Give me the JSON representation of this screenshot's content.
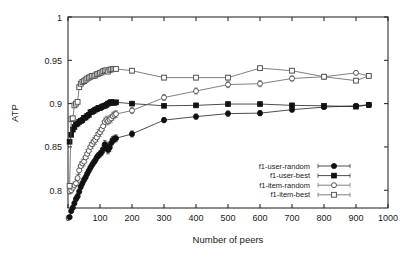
{
  "chart_data": {
    "type": "line",
    "title": "",
    "xlabel": "Number of peers",
    "ylabel": "ATP",
    "xlim": [
      0,
      1000
    ],
    "ylim": [
      0.7795,
      1.0
    ],
    "grid": false,
    "legend_position": "lower-right-inside",
    "xticks": [
      "0",
      "100",
      "200",
      "300",
      "400",
      "500",
      "600",
      "700",
      "800",
      "900",
      "1000"
    ],
    "xtick_values": [
      0,
      100,
      200,
      300,
      400,
      500,
      600,
      700,
      800,
      900,
      1000
    ],
    "yticks": [
      "0.8",
      "0.85",
      "0.9",
      "0.95",
      "1"
    ],
    "ytick_values": [
      0.8,
      0.85,
      0.9,
      0.95,
      1.0
    ],
    "series": [
      {
        "name": "f1-user-random",
        "marker": "filled-circle",
        "color": "#111111",
        "x": [
          5,
          10,
          15,
          20,
          25,
          30,
          35,
          40,
          45,
          50,
          55,
          60,
          65,
          70,
          75,
          80,
          85,
          90,
          95,
          100,
          105,
          110,
          115,
          120,
          125,
          130,
          135,
          140,
          145,
          150,
          200,
          300,
          400,
          500,
          600,
          700,
          800,
          900,
          940
        ],
        "values": [
          0.769,
          0.776,
          0.78,
          0.785,
          0.79,
          0.793,
          0.7985,
          0.804,
          0.808,
          0.812,
          0.815,
          0.819,
          0.8225,
          0.826,
          0.829,
          0.832,
          0.8345,
          0.838,
          0.84,
          0.842,
          0.844,
          0.8475,
          0.853,
          0.851,
          0.8465,
          0.849,
          0.8545,
          0.858,
          0.859,
          0.86,
          0.865,
          0.881,
          0.885,
          0.8885,
          0.889,
          0.893,
          0.896,
          0.8975,
          0.8985
        ],
        "errors": [
          0.002,
          0.002,
          0.0025,
          0.0025,
          0.003,
          0.003,
          0.003,
          0.003,
          0.003,
          0.003,
          0.003,
          0.003,
          0.003,
          0.003,
          0.003,
          0.003,
          0.0035,
          0.0035,
          0.0035,
          0.0035,
          0.004,
          0.004,
          0.0045,
          0.0045,
          0.0045,
          0.0045,
          0.0045,
          0.004,
          0.004,
          0.004,
          0.0035,
          0.003,
          0.003,
          0.003,
          0.003,
          0.0025,
          0.002,
          0.0018,
          0.0015
        ]
      },
      {
        "name": "f1-user-best",
        "marker": "filled-square",
        "color": "#111111",
        "x": [
          5,
          10,
          15,
          20,
          25,
          30,
          35,
          40,
          45,
          50,
          55,
          60,
          65,
          70,
          75,
          80,
          85,
          90,
          95,
          100,
          105,
          110,
          115,
          120,
          125,
          130,
          135,
          140,
          145,
          150,
          200,
          300,
          400,
          500,
          600,
          700,
          800,
          900,
          940
        ],
        "values": [
          0.856,
          0.864,
          0.87,
          0.873,
          0.876,
          0.877,
          0.879,
          0.88,
          0.881,
          0.8835,
          0.884,
          0.886,
          0.887,
          0.89,
          0.8905,
          0.8915,
          0.893,
          0.8935,
          0.895,
          0.895,
          0.896,
          0.897,
          0.8975,
          0.8985,
          0.9,
          0.901,
          0.902,
          0.901,
          0.901,
          0.9015,
          0.9,
          0.8975,
          0.898,
          0.8995,
          0.8995,
          0.898,
          0.8975,
          0.8965,
          0.8985
        ],
        "errors": [
          0.0018,
          0.0018,
          0.0018,
          0.0018,
          0.0018,
          0.0018,
          0.0018,
          0.0018,
          0.0018,
          0.0018,
          0.0018,
          0.0018,
          0.0018,
          0.0018,
          0.0018,
          0.0018,
          0.0018,
          0.0018,
          0.0018,
          0.0018,
          0.0018,
          0.0018,
          0.0018,
          0.0018,
          0.0018,
          0.0018,
          0.0018,
          0.0018,
          0.0018,
          0.0018,
          0.002,
          0.002,
          0.002,
          0.0018,
          0.0018,
          0.0018,
          0.0018,
          0.0018,
          0.0015
        ]
      },
      {
        "name": "f1-item-random",
        "marker": "open-circle",
        "color": "#555555",
        "x": [
          5,
          10,
          15,
          20,
          25,
          30,
          35,
          40,
          45,
          50,
          55,
          60,
          65,
          70,
          75,
          80,
          85,
          90,
          95,
          100,
          105,
          110,
          115,
          120,
          125,
          130,
          135,
          140,
          145,
          150,
          200,
          300,
          400,
          500,
          600,
          700,
          800,
          900,
          940
        ],
        "values": [
          0.799,
          0.8,
          0.803,
          0.806,
          0.808,
          0.814,
          0.823,
          0.828,
          0.831,
          0.833,
          0.838,
          0.842,
          0.8455,
          0.85,
          0.853,
          0.856,
          0.858,
          0.861,
          0.865,
          0.867,
          0.87,
          0.874,
          0.879,
          0.881,
          0.88,
          0.8815,
          0.883,
          0.8855,
          0.887,
          0.888,
          0.892,
          0.907,
          0.9145,
          0.922,
          0.923,
          0.929,
          0.931,
          0.9355,
          0.932
        ],
        "errors": [
          0.0035,
          0.0035,
          0.0035,
          0.0035,
          0.004,
          0.0045,
          0.005,
          0.005,
          0.005,
          0.005,
          0.005,
          0.005,
          0.005,
          0.005,
          0.005,
          0.005,
          0.005,
          0.005,
          0.005,
          0.005,
          0.005,
          0.005,
          0.0045,
          0.0045,
          0.0045,
          0.0045,
          0.0045,
          0.0045,
          0.004,
          0.004,
          0.0035,
          0.0035,
          0.0035,
          0.0035,
          0.0035,
          0.003,
          0.0025,
          0.0022,
          0.002
        ]
      },
      {
        "name": "f1-item-best",
        "marker": "open-square",
        "color": "#555555",
        "x": [
          5,
          10,
          15,
          20,
          25,
          30,
          35,
          40,
          45,
          50,
          55,
          60,
          65,
          70,
          75,
          80,
          85,
          90,
          95,
          100,
          105,
          110,
          115,
          120,
          125,
          130,
          135,
          140,
          145,
          150,
          200,
          300,
          400,
          500,
          600,
          700,
          800,
          900,
          940
        ],
        "values": [
          0.805,
          0.882,
          0.883,
          0.898,
          0.9,
          0.902,
          0.919,
          0.923,
          0.925,
          0.926,
          0.9275,
          0.929,
          0.93,
          0.931,
          0.932,
          0.932,
          0.9325,
          0.934,
          0.9345,
          0.9355,
          0.936,
          0.9375,
          0.938,
          0.9385,
          0.937,
          0.939,
          0.9395,
          0.94,
          0.94,
          0.94,
          0.938,
          0.93,
          0.93,
          0.93,
          0.941,
          0.938,
          0.931,
          0.9265,
          0.932
        ],
        "errors": [
          0.0025,
          0.0025,
          0.0025,
          0.0025,
          0.0025,
          0.0025,
          0.0025,
          0.0025,
          0.0025,
          0.0025,
          0.0025,
          0.0025,
          0.0025,
          0.0025,
          0.0025,
          0.0025,
          0.0025,
          0.0025,
          0.0025,
          0.0025,
          0.0025,
          0.0025,
          0.0025,
          0.0025,
          0.0025,
          0.0025,
          0.0025,
          0.0025,
          0.0025,
          0.0025,
          0.0025,
          0.0025,
          0.0025,
          0.0025,
          0.0025,
          0.0025,
          0.0022,
          0.002,
          0.0018
        ]
      }
    ]
  },
  "legend": {
    "entries": [
      {
        "label": "f1-user-random"
      },
      {
        "label": "f1-user-best"
      },
      {
        "label": "f1-item-random"
      },
      {
        "label": "f1-item-best"
      }
    ]
  },
  "colors": {
    "axis": "#1a1a1a",
    "background": "#ffffff",
    "filled": "#111111",
    "open": "#555555"
  }
}
